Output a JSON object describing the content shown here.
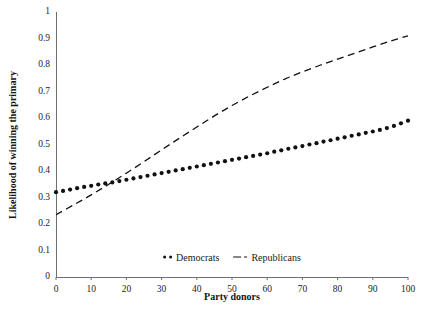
{
  "chart_data": {
    "type": "line",
    "title": "",
    "xlabel": "Party donors",
    "ylabel": "Likelihood of winning the primary",
    "xlim": [
      0,
      100
    ],
    "ylim": [
      0,
      1
    ],
    "grid": false,
    "legend_position": "bottom-center",
    "xticks": [
      "0",
      "10",
      "20",
      "30",
      "40",
      "50",
      "60",
      "70",
      "80",
      "90",
      "100"
    ],
    "xtick_values": [
      0,
      10,
      20,
      30,
      40,
      50,
      60,
      70,
      80,
      90,
      100
    ],
    "yticks": [
      "0",
      "0.1",
      "0.2",
      "0.3",
      "0.4",
      "0.5",
      "0.6",
      "0.7",
      "0.8",
      "0.9",
      "1"
    ],
    "ytick_values": [
      0,
      0.1,
      0.2,
      0.3,
      0.4,
      0.5,
      0.6,
      0.7,
      0.8,
      0.9,
      1
    ],
    "series": [
      {
        "name": "Democrats",
        "style": "dotted-markers",
        "color": "#111111",
        "x": [
          0,
          2,
          4,
          6,
          8,
          10,
          12,
          14,
          16,
          18,
          20,
          22,
          24,
          26,
          28,
          30,
          32,
          34,
          36,
          38,
          40,
          42,
          44,
          46,
          48,
          50,
          52,
          54,
          56,
          58,
          60,
          62,
          64,
          66,
          68,
          70,
          72,
          74,
          76,
          78,
          80,
          82,
          84,
          86,
          88,
          90,
          92,
          94,
          96,
          98,
          100
        ],
        "values": [
          0.32,
          0.325,
          0.33,
          0.335,
          0.34,
          0.344,
          0.349,
          0.353,
          0.357,
          0.362,
          0.367,
          0.372,
          0.377,
          0.382,
          0.387,
          0.392,
          0.397,
          0.402,
          0.407,
          0.412,
          0.417,
          0.422,
          0.427,
          0.432,
          0.437,
          0.442,
          0.447,
          0.452,
          0.457,
          0.462,
          0.467,
          0.473,
          0.478,
          0.484,
          0.489,
          0.494,
          0.5,
          0.505,
          0.511,
          0.516,
          0.522,
          0.527,
          0.533,
          0.538,
          0.544,
          0.549,
          0.555,
          0.562,
          0.57,
          0.58,
          0.59
        ]
      },
      {
        "name": "Republicans",
        "style": "dashed-line",
        "color": "#111111",
        "x": [
          0,
          5,
          10,
          15,
          20,
          25,
          30,
          35,
          40,
          45,
          50,
          55,
          60,
          65,
          70,
          75,
          80,
          85,
          90,
          95,
          100
        ],
        "values": [
          0.235,
          0.272,
          0.31,
          0.35,
          0.392,
          0.435,
          0.48,
          0.523,
          0.566,
          0.608,
          0.647,
          0.683,
          0.716,
          0.747,
          0.774,
          0.799,
          0.822,
          0.845,
          0.868,
          0.89,
          0.91
        ]
      }
    ],
    "annotations": [],
    "crossover_x": 17.5,
    "crossover_y": 0.356
  },
  "legend": {
    "entries": [
      {
        "label": "Democrats",
        "marker": "two-dots-icon"
      },
      {
        "label": "Republicans",
        "marker": "dash-dot-line-icon"
      }
    ]
  },
  "axes": {
    "x_title": "Party donors",
    "y_title": "Likelihood of winning the primary"
  },
  "colors": {
    "ink": "#111111",
    "axis": "#6a6a6a",
    "background": "#ffffff"
  }
}
